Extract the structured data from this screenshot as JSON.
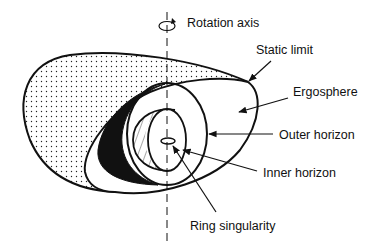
{
  "diagram": {
    "labels": {
      "rotation_axis": "Rotation axis",
      "static_limit": "Static limit",
      "ergosphere": "Ergosphere",
      "outer_horizon": "Outer horizon",
      "inner_horizon": "Inner horizon",
      "ring_singularity": "Ring singularity"
    },
    "colors": {
      "ink": "#111111",
      "background": "#ffffff"
    }
  }
}
